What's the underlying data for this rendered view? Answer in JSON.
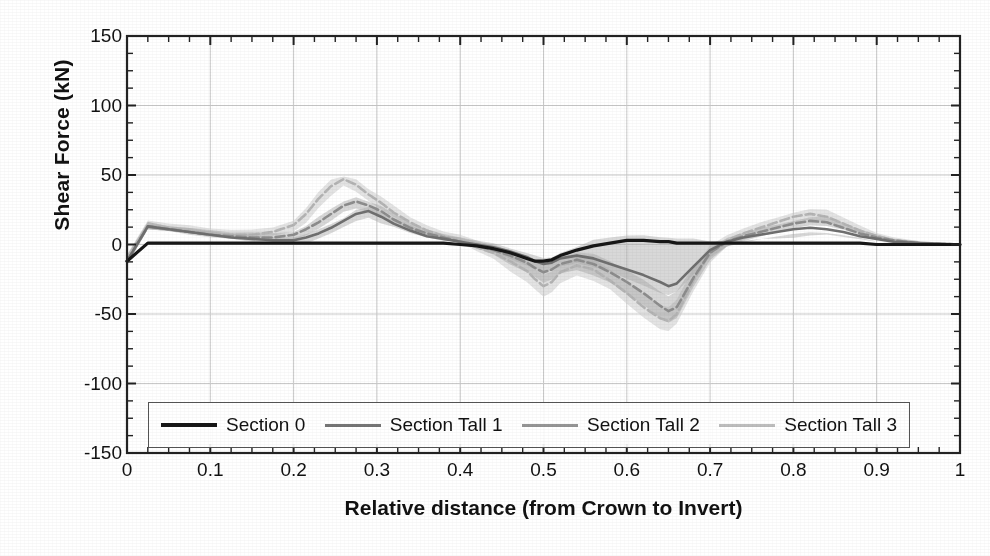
{
  "chart_data": {
    "type": "line",
    "title": "",
    "xlabel": "Relative distance (from Crown to Invert)",
    "ylabel": "Shear Force (kN)",
    "xlim": [
      0,
      1
    ],
    "ylim": [
      -150,
      150
    ],
    "xticks": [
      "0",
      "0.1",
      "0.2",
      "0.3",
      "0.4",
      "0.5",
      "0.6",
      "0.7",
      "0.8",
      "0.9",
      "1"
    ],
    "xtick_values": [
      0,
      0.1,
      0.2,
      0.3,
      0.4,
      0.5,
      0.6,
      0.7,
      0.8,
      0.9,
      1
    ],
    "yticks": [
      "150",
      "100",
      "50",
      "0",
      "-50",
      "-100",
      "-150"
    ],
    "ytick_values": [
      150,
      100,
      50,
      0,
      -50,
      -100,
      -150
    ],
    "grid": true,
    "grid_color": "#c9c9c9",
    "minor_ticks": true,
    "legend_position": "bottom-inside",
    "units": "kN",
    "x": [
      0,
      0.025,
      0.05,
      0.075,
      0.1,
      0.125,
      0.15,
      0.175,
      0.2,
      0.215,
      0.23,
      0.245,
      0.26,
      0.275,
      0.29,
      0.305,
      0.32,
      0.34,
      0.36,
      0.38,
      0.4,
      0.42,
      0.44,
      0.46,
      0.48,
      0.49,
      0.5,
      0.51,
      0.52,
      0.54,
      0.56,
      0.58,
      0.6,
      0.62,
      0.64,
      0.65,
      0.66,
      0.68,
      0.7,
      0.72,
      0.74,
      0.76,
      0.78,
      0.8,
      0.82,
      0.84,
      0.86,
      0.88,
      0.9,
      0.92,
      0.95,
      1
    ],
    "series": [
      {
        "name": "Section 0",
        "color": "#161616",
        "width": 3.2,
        "dash": "solid",
        "values": [
          -12,
          1,
          1,
          1,
          1,
          1,
          1,
          1,
          1,
          1,
          1,
          1,
          1,
          1,
          1,
          1,
          1,
          1,
          1,
          1,
          0,
          -1,
          -3,
          -6,
          -10,
          -12,
          -12,
          -11,
          -8,
          -4,
          -1,
          1,
          3,
          3,
          2,
          2,
          1,
          1,
          1,
          1,
          1,
          1,
          1,
          1,
          1,
          1,
          1,
          1,
          0,
          0,
          0,
          0
        ]
      },
      {
        "name": "Section Tall 1",
        "color": "#6f6f6f",
        "width": 2.6,
        "dash": "solid",
        "values": [
          -12,
          13,
          11,
          9,
          7,
          5,
          4,
          3,
          3,
          5,
          8,
          12,
          17,
          22,
          24,
          20,
          15,
          10,
          6,
          4,
          2,
          0,
          -2,
          -5,
          -9,
          -12,
          -14,
          -13,
          -10,
          -8,
          -10,
          -14,
          -18,
          -22,
          -27,
          -30,
          -28,
          -16,
          -4,
          2,
          5,
          7,
          9,
          11,
          12,
          11,
          9,
          6,
          4,
          2,
          1,
          0
        ]
      },
      {
        "name": "Section Tall 2",
        "color": "#8d8d8d",
        "width": 2.6,
        "dash": "dashed",
        "values": [
          -12,
          13,
          11,
          9,
          7,
          6,
          5,
          5,
          7,
          11,
          16,
          22,
          28,
          31,
          28,
          24,
          18,
          12,
          8,
          5,
          2,
          -1,
          -4,
          -8,
          -13,
          -17,
          -20,
          -18,
          -14,
          -11,
          -14,
          -20,
          -27,
          -35,
          -44,
          -48,
          -45,
          -24,
          -6,
          2,
          6,
          9,
          12,
          15,
          17,
          16,
          12,
          8,
          5,
          3,
          1,
          0
        ]
      },
      {
        "name": "Section Tall 3",
        "color": "#b4b4b4",
        "width": 2.6,
        "dash": "dashed",
        "values": [
          -12,
          13,
          12,
          10,
          8,
          7,
          7,
          9,
          14,
          22,
          33,
          42,
          47,
          43,
          36,
          30,
          23,
          16,
          10,
          6,
          3,
          -2,
          -6,
          -12,
          -19,
          -25,
          -30,
          -27,
          -20,
          -15,
          -18,
          -26,
          -35,
          -45,
          -53,
          -55,
          -50,
          -26,
          -6,
          3,
          8,
          12,
          16,
          20,
          22,
          20,
          15,
          10,
          6,
          3,
          1,
          0
        ]
      }
    ],
    "bands": [
      {
        "name": "Section Tall 1 band",
        "fill": "#a8a8a8",
        "opacity": 0.45,
        "upper": [
          -8,
          15,
          13,
          11,
          9,
          7,
          6,
          5,
          6,
          8,
          11,
          15,
          20,
          25,
          27,
          23,
          18,
          13,
          8,
          6,
          4,
          2,
          0,
          -2,
          -5,
          -7,
          -9,
          -8,
          -5,
          -1,
          2,
          4,
          6,
          6,
          5,
          4,
          3,
          3,
          3,
          3,
          3,
          4,
          5,
          6,
          7,
          6,
          5,
          3,
          2,
          1,
          1,
          0
        ],
        "lower": [
          -14,
          10,
          9,
          7,
          5,
          3,
          2,
          1,
          1,
          2,
          5,
          9,
          13,
          18,
          20,
          16,
          12,
          7,
          4,
          2,
          0,
          -3,
          -6,
          -9,
          -14,
          -17,
          -19,
          -18,
          -15,
          -12,
          -15,
          -20,
          -25,
          -30,
          -35,
          -37,
          -35,
          -22,
          -8,
          -1,
          2,
          4,
          6,
          8,
          9,
          8,
          6,
          4,
          2,
          1,
          0,
          0
        ]
      },
      {
        "name": "Section Tall 2 band",
        "fill": "#9a9a9a",
        "opacity": 0.4,
        "upper": [
          -8,
          15,
          13,
          11,
          10,
          8,
          8,
          8,
          10,
          14,
          20,
          26,
          32,
          34,
          31,
          27,
          21,
          15,
          10,
          7,
          4,
          1,
          -1,
          -4,
          -8,
          -11,
          -13,
          -11,
          -8,
          -5,
          -8,
          -13,
          -19,
          -26,
          -34,
          -38,
          -35,
          -17,
          -2,
          5,
          9,
          12,
          15,
          18,
          20,
          19,
          15,
          10,
          7,
          4,
          2,
          0
        ],
        "lower": [
          -14,
          10,
          9,
          8,
          6,
          4,
          3,
          3,
          4,
          8,
          12,
          18,
          24,
          27,
          24,
          20,
          15,
          9,
          6,
          3,
          0,
          -4,
          -8,
          -13,
          -19,
          -23,
          -27,
          -25,
          -20,
          -17,
          -21,
          -28,
          -36,
          -44,
          -53,
          -57,
          -54,
          -31,
          -10,
          -1,
          3,
          6,
          9,
          12,
          14,
          13,
          10,
          6,
          3,
          2,
          0,
          0
        ]
      },
      {
        "name": "Section Tall 3 band",
        "fill": "#cccccc",
        "opacity": 0.55,
        "upper": [
          -7,
          16,
          15,
          13,
          11,
          10,
          10,
          12,
          18,
          27,
          38,
          47,
          50,
          47,
          40,
          34,
          27,
          19,
          13,
          9,
          6,
          2,
          -2,
          -6,
          -12,
          -17,
          -21,
          -18,
          -13,
          -9,
          -12,
          -19,
          -27,
          -36,
          -44,
          -46,
          -41,
          -18,
          0,
          7,
          12,
          16,
          20,
          24,
          26,
          24,
          19,
          13,
          8,
          5,
          2,
          0
        ],
        "lower": [
          -15,
          10,
          9,
          8,
          6,
          5,
          5,
          6,
          10,
          17,
          27,
          36,
          43,
          39,
          32,
          26,
          19,
          12,
          7,
          3,
          0,
          -6,
          -11,
          -18,
          -26,
          -32,
          -37,
          -34,
          -27,
          -21,
          -25,
          -33,
          -43,
          -53,
          -61,
          -63,
          -58,
          -34,
          -12,
          -1,
          4,
          8,
          12,
          16,
          18,
          16,
          11,
          7,
          4,
          2,
          0,
          0
        ]
      }
    ]
  },
  "legend": {
    "items": [
      {
        "label": "Section 0",
        "color": "#161616",
        "width": 4
      },
      {
        "label": "Section Tall 1",
        "color": "#757575",
        "width": 3
      },
      {
        "label": "Section Tall 2",
        "color": "#959595",
        "width": 3
      },
      {
        "label": "Section Tall 3",
        "color": "#bdbdbd",
        "width": 3
      }
    ]
  },
  "axes": {
    "x_title": "Relative distance (from Crown to Invert)",
    "y_title": "Shear Force (kN)"
  }
}
